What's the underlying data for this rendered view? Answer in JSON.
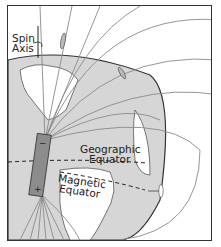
{
  "diagram": {
    "labels": {
      "spin_axis_line1": "Spin",
      "spin_axis_line2": "Axis",
      "geographic_line1": "Geographic",
      "geographic_line2": "Equator",
      "magnetic_line1": "Magnetic",
      "magnetic_line2": "Equator",
      "magnet_top_pole": "−",
      "magnet_bottom_pole": "+"
    },
    "colors": {
      "globe": "#d6d6d6",
      "land": "#ffffff",
      "field_lines": "#8a8a8a",
      "bar_magnet": "#8c8c8c",
      "outline": "#333333"
    }
  }
}
